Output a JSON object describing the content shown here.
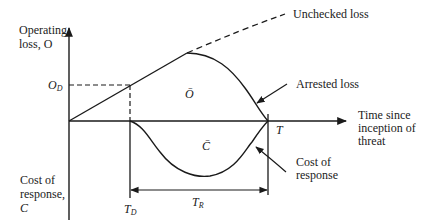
{
  "diagram": {
    "y_axis_top_label_line1": "Operating",
    "y_axis_top_label_line2": "loss, O",
    "y_axis_bottom_label_line1": "Cost of",
    "y_axis_bottom_label_line2": "response,",
    "y_axis_bottom_label_line3": "C",
    "x_axis_label_line1": "Time since",
    "x_axis_label_line2": "inception of",
    "x_axis_label_line3": "threat",
    "od_label_main": "O",
    "od_label_sub": "D",
    "td_label_main": "T",
    "td_label_sub": "D",
    "t_label": "T",
    "tr_label_main": "T",
    "tr_label_sub": "R",
    "o_bar_label": "Ō",
    "c_bar_label": "C̄",
    "unchecked_loss_label": "Unchecked loss",
    "arrested_loss_label": "Arrested loss",
    "cost_of_response_line1": "Cost of",
    "cost_of_response_line2": "response",
    "colors": {
      "line": "#1a1a1a",
      "background": "#ffffff"
    }
  }
}
